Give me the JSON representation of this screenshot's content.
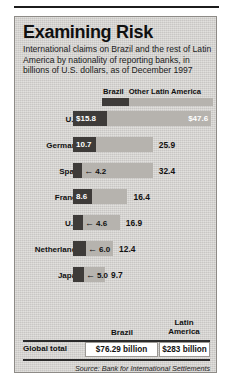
{
  "chart_data": {
    "type": "bar",
    "title": "Examining Risk",
    "subtitle": "International claims on Brazil and the rest of Latin America by nationality of reporting banks, in billions of U.S. dollars, as of December 1997",
    "xlabel": "",
    "ylabel": "",
    "stacked": true,
    "grid": false,
    "legend_position": "top",
    "legend": [
      "Brazil",
      "Other Latin America"
    ],
    "categories": [
      "U.S.",
      "Germany",
      "Spain",
      "France",
      "U.K.",
      "Netherlands",
      "Japan"
    ],
    "series": [
      {
        "name": "Brazil",
        "values": [
          15.8,
          10.7,
          4.2,
          8.6,
          4.6,
          6.0,
          5.0
        ]
      },
      {
        "name": "Other Latin America",
        "values": [
          47.6,
          25.9,
          32.4,
          16.4,
          16.9,
          12.4,
          9.7
        ]
      }
    ],
    "value_labels": {
      "Brazil": [
        "$15.8",
        "10.7",
        "4.2",
        "8.6",
        "4.6",
        "6.0",
        "5.0"
      ],
      "Other Latin America": [
        "$47.6",
        "25.9",
        "32.4",
        "16.4",
        "16.9",
        "12.4",
        "9.7"
      ]
    },
    "units": "billions of U.S. dollars",
    "as_of": "December 1997",
    "totals": {
      "Brazil": "$76.29 billion",
      "Latin America": "$283 billion"
    },
    "source": "Source: Bank for International Settlements"
  },
  "header": {
    "title": "Examining Risk",
    "subtitle": "International claims on Brazil and the rest of Latin America by nationality of reporting banks, in billions of U.S. dollars, as of December 1997"
  },
  "legend": {
    "brazil_label": "Brazil",
    "other_label": "Other Latin America"
  },
  "rows": [
    {
      "label": "U.S.",
      "brazil": "$15.8",
      "other": "$47.6",
      "brazil_inside": true,
      "other_inside": true,
      "arrow": false
    },
    {
      "label": "Germany",
      "brazil": "10.7",
      "other": "25.9",
      "brazil_inside": true,
      "other_inside": false,
      "arrow": false
    },
    {
      "label": "Spain",
      "brazil": "4.2",
      "other": "32.4",
      "brazil_inside": false,
      "other_inside": false,
      "arrow": true
    },
    {
      "label": "France",
      "brazil": "8.6",
      "other": "16.4",
      "brazil_inside": true,
      "other_inside": false,
      "arrow": false
    },
    {
      "label": "U.K.",
      "brazil": "4.6",
      "other": "16.9",
      "brazil_inside": false,
      "other_inside": false,
      "arrow": true
    },
    {
      "label": "Netherlands",
      "brazil": "6.0",
      "other": "12.4",
      "brazil_inside": false,
      "other_inside": false,
      "arrow": true
    },
    {
      "label": "Japan",
      "brazil": "5.0",
      "other": "9.7",
      "brazil_inside": false,
      "other_inside": false,
      "arrow": true
    }
  ],
  "totals_table": {
    "col_brazil": "Brazil",
    "col_latin": "Latin\nAmerica",
    "col_latin_line1": "Latin",
    "col_latin_line2": "America",
    "row_label": "Global total",
    "brazil_value": "$76.29 billion",
    "latin_value": "$283 billion"
  },
  "footer": {
    "source": "Source: Bank for International Settlements"
  },
  "colors": {
    "brazil": "#3e3b39",
    "other": "#b6b3ae",
    "panel": "#d7d5d2",
    "ink": "#101010"
  },
  "arrow_glyph": "←"
}
